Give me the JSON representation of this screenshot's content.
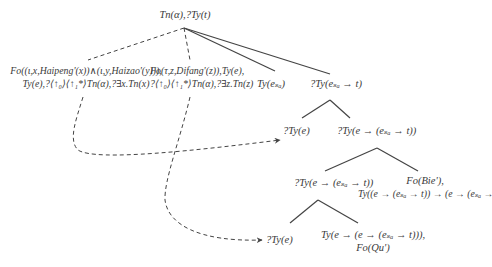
{
  "diagram": {
    "type": "tree",
    "nodes": {
      "root": {
        "lines": [
          "Tn(α),?Ty(t)"
        ]
      },
      "adjunct_left": {
        "lines": [
          "Fo((ι,x,Haipeng'(x))∧(ι,y,Haizao'(y))),",
          "Ty(e),?⟨↑₀⟩⟨↑₁*⟩Tn(α),?∃x.Tn(x)"
        ]
      },
      "adjunct_right": {
        "lines": [
          "Fo(τ,z,Difang'(z)),Ty(e),",
          "?⟨↑₀⟩⟨↑₁*⟩Tn(α),?∃z.Tn(z)"
        ]
      },
      "event_arg": {
        "lines": [
          "Ty(eₛₐ)"
        ]
      },
      "predicate": {
        "lines": [
          "?Ty(eₛₐ → t)"
        ]
      },
      "subject": {
        "lines": [
          "?Ty(e)"
        ]
      },
      "pred2": {
        "lines": [
          "?Ty(e → (eₛₐ → t))"
        ]
      },
      "pred3": {
        "lines": [
          "?Ty(e → (eₛₐ → t))"
        ]
      },
      "bie": {
        "lines": [
          "Fo(Bie'),",
          "Ty((e → (eₛₐ → t)) → (e → (eₛₐ → t)))"
        ]
      },
      "object": {
        "lines": [
          "?Ty(e)"
        ]
      },
      "qu": {
        "lines": [
          "Ty(e → (e → (eₛₐ → t))),",
          "Fo(Qu')"
        ]
      }
    },
    "edges": [
      {
        "from": "root",
        "to": "adjunct_left",
        "style": "dashed"
      },
      {
        "from": "root",
        "to": "adjunct_right",
        "style": "dashed"
      },
      {
        "from": "root",
        "to": "event_arg",
        "style": "solid"
      },
      {
        "from": "root",
        "to": "predicate",
        "style": "solid"
      },
      {
        "from": "predicate",
        "to": "subject",
        "style": "solid"
      },
      {
        "from": "predicate",
        "to": "pred2",
        "style": "solid"
      },
      {
        "from": "pred2",
        "to": "pred3",
        "style": "solid"
      },
      {
        "from": "pred2",
        "to": "bie",
        "style": "solid"
      },
      {
        "from": "pred3",
        "to": "object",
        "style": "solid"
      },
      {
        "from": "pred3",
        "to": "qu",
        "style": "solid"
      },
      {
        "from": "adjunct_left",
        "to": "subject",
        "style": "dashed-arrow"
      },
      {
        "from": "adjunct_right",
        "to": "object",
        "style": "dashed-arrow"
      }
    ],
    "colors": {
      "line": "#444444",
      "text": "#3a3a3a",
      "background": "#ffffff"
    }
  }
}
